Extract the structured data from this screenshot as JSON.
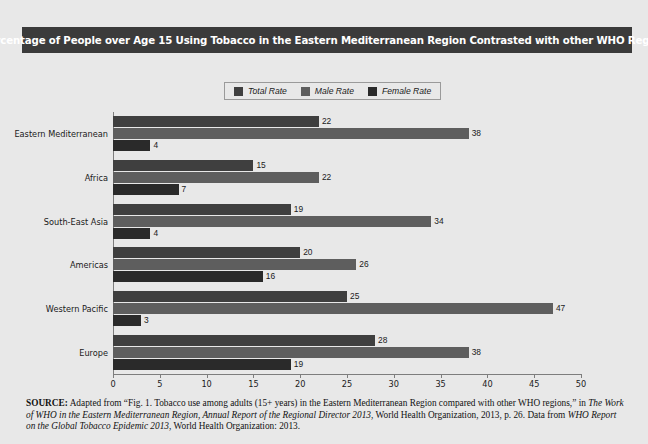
{
  "title": "Percentage of People over Age 15 Using Tobacco in the Eastern Mediterranean Region Contrasted with other WHO Regions",
  "colors": {
    "panel_background": "#e8e8e8",
    "title_bar": "#3b3b3b",
    "title_text": "#ffffff",
    "total_rate": "#3f3f3f",
    "male_rate": "#5e5e5e",
    "female_rate": "#2a2a2a",
    "axis_line": "#7d7d7d",
    "legend_border": "#9a9a9a"
  },
  "legend": {
    "entries": [
      {
        "label": "Total Rate",
        "color": "#3f3f3f"
      },
      {
        "label": "Male Rate",
        "color": "#5e5e5e"
      },
      {
        "label": "Female Rate",
        "color": "#2a2a2a"
      }
    ]
  },
  "chart_data": {
    "type": "bar",
    "orientation": "horizontal",
    "title": "Percentage of People over Age 15 Using Tobacco in the Eastern Mediterranean Region Contrasted with other WHO Regions",
    "xlabel": "",
    "ylabel": "",
    "xlim": [
      0,
      50
    ],
    "xticks": [
      0,
      5,
      10,
      15,
      20,
      25,
      30,
      35,
      40,
      45,
      50
    ],
    "grid": false,
    "legend_position": "top-center",
    "categories": [
      "Eastern Mediterranean",
      "Africa",
      "South-East Asia",
      "Americas",
      "Western Pacific",
      "Europe"
    ],
    "series": [
      {
        "name": "Total Rate",
        "color": "#3f3f3f",
        "values": [
          22,
          15,
          19,
          20,
          25,
          28
        ]
      },
      {
        "name": "Male Rate",
        "color": "#5e5e5e",
        "values": [
          38,
          22,
          34,
          26,
          47,
          38
        ]
      },
      {
        "name": "Female Rate",
        "color": "#2a2a2a",
        "values": [
          4,
          7,
          4,
          16,
          3,
          19
        ]
      }
    ]
  },
  "source": {
    "lead": "SOURCE:",
    "part1": " Adapted from “Fig. 1. Tobacco use among adults (15+ years) in the Eastern Mediterranean Region compared with other WHO regions,” in ",
    "italic1": "The Work of WHO in the Eastern Mediterranean Region, Annual Report of the Regional Director 2013",
    "part2": ", World Health Organization, 2013, p. 26. Data from ",
    "italic2": "WHO Report on the Global Tobacco Epidemic 2013",
    "part3": ", World Health Organization: 2013."
  }
}
